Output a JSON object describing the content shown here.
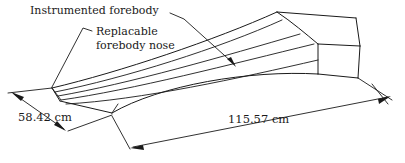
{
  "figure": {
    "kind": "engineering-line-drawing",
    "background_color": "#ffffff",
    "line_color": "#1a1a1a"
  },
  "annotations": [
    {
      "id": "instrumented-forebody",
      "text": "Instrumented forebody",
      "text_x": 30,
      "text_y": 14
    },
    {
      "id": "replacable-forebody-nose",
      "line1": "Replacable",
      "line2": "forebody nose",
      "text_x": 96,
      "text_y": 35
    }
  ],
  "dimensions": [
    {
      "id": "width-dimension",
      "value": "58.42 cm",
      "text_x": 18,
      "text_y": 121
    },
    {
      "id": "length-dimension",
      "value": "115.57 cm",
      "text_x": 228,
      "text_y": 123
    }
  ]
}
